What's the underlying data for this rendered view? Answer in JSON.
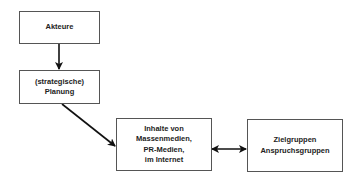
{
  "diagram": {
    "nodes": [
      {
        "id": "akteure",
        "label": "Akteure"
      },
      {
        "id": "planung",
        "label": "(strategische)\nPlanung"
      },
      {
        "id": "inhalte",
        "label": "Inhalte von\nMassenmedien,\nPR-Medien,\nim Internet"
      },
      {
        "id": "zielgruppen",
        "label": "Zielgruppen\nAnspruchsgruppen"
      }
    ],
    "edges": [
      {
        "from": "akteure",
        "to": "planung",
        "type": "directed"
      },
      {
        "from": "planung",
        "to": "inhalte",
        "type": "directed"
      },
      {
        "from": "inhalte",
        "to": "zielgruppen",
        "type": "bidirectional"
      }
    ]
  }
}
